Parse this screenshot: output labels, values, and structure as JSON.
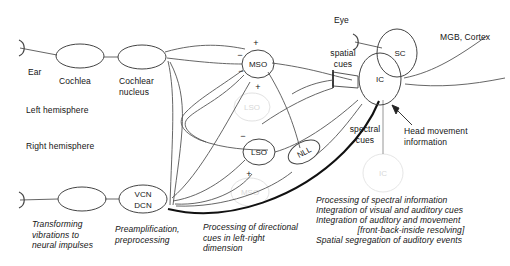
{
  "figure": {
    "stroke_color": "#4a4a4a",
    "ghost_color": "#dcdcdc",
    "thick_color": "#111111",
    "text_color": "#151515"
  },
  "hemispheres": {
    "left_label": "Left hemisphere",
    "right_label": "Right hemisphere"
  },
  "nodes": {
    "ear": "Ear",
    "cochlea": "Cochlea",
    "cochlear_nucleus": "Cochlear\nnucleus",
    "mso": "MSO",
    "lso": "LSO",
    "nll": "NLL",
    "ic": "IC",
    "sc": "SC",
    "vcn": "VCN",
    "dcn": "DCN",
    "eye": "Eye",
    "ghost_lso": "LSO",
    "ghost_mso": "MSO",
    "ghost_ic": "IC"
  },
  "signs": {
    "mso_top": "+",
    "mso_left_upper": "−",
    "mso_left_lower": "−",
    "mso_bottom": "+",
    "lso_top": "−",
    "lso_bottom": "+"
  },
  "cue_labels": {
    "spatial": "spatial\ncues",
    "spectral": "spectral\ncues",
    "head_movement": "Head movement\ninformation",
    "mgb_cortex": "MGB, Cortex"
  },
  "captions": {
    "ear_caption": "Transforming\nvibrations to\nneural impulses",
    "cn_caption": "Preamplification,\npreprocessing",
    "mso_lso_caption": "Processing of directional\ncues in left-right\ndimension",
    "ic_caption_lines": [
      "Processing of spectral information",
      "Integration of visual and auditory cues",
      "Integration of auditory and movement",
      "[front-back-inside resolving]",
      "Spatial segregation of auditory events"
    ]
  }
}
